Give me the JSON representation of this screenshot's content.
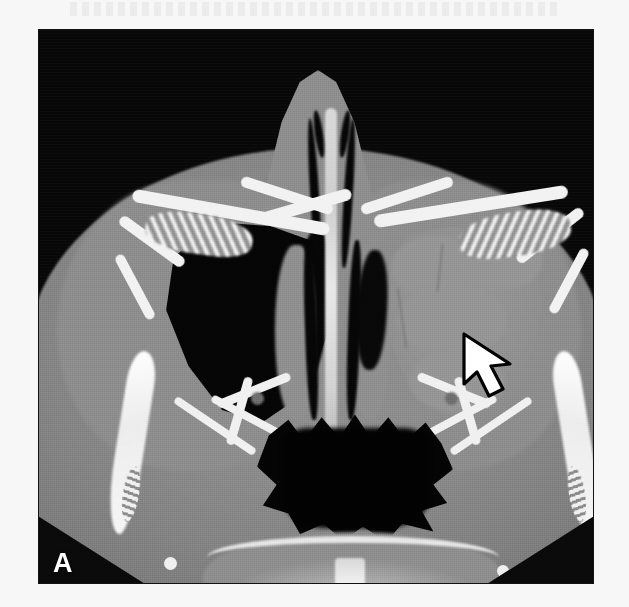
{
  "figure": {
    "panel_label": "A",
    "modality": "CT",
    "plane": "axial",
    "region": "paranasal sinuses",
    "window": "bone",
    "background_color": "#f7f7f7",
    "frame_color": "#0a0a0a"
  },
  "annotations": [
    {
      "name": "arrow-marker",
      "shape": "arrow",
      "direction": "up-left",
      "fill_color": "#ffffff",
      "outline_color": "#000000",
      "x": 419,
      "y": 300,
      "width": 64,
      "height": 70,
      "points_at": "opacified left maxillary sinus"
    }
  ],
  "anatomy": {
    "midline": [
      {
        "name": "nasal-septum",
        "density": "bone",
        "color": "#dcdcdc"
      },
      {
        "name": "nasal-airway-left",
        "density": "air",
        "color": "#060606"
      },
      {
        "name": "nasal-airway-right",
        "density": "air",
        "color": "#060606"
      },
      {
        "name": "nasopharyngeal-airspace",
        "density": "air",
        "color": "#040404"
      }
    ],
    "sinuses": [
      {
        "name": "maxillary-sinus-image-left",
        "status": "aerated",
        "density": "air",
        "color": "#050505"
      },
      {
        "name": "maxillary-sinus-image-right",
        "status": "opacified",
        "density": "soft-tissue",
        "color": "#909090"
      },
      {
        "name": "ethmoid-air-cells-left",
        "status": "aerated",
        "density": "mixed"
      },
      {
        "name": "ethmoid-air-cells-right",
        "status": "aerated",
        "density": "mixed"
      }
    ],
    "bone": [
      {
        "name": "zygomatic-arch-left",
        "color": "#f4f4f4"
      },
      {
        "name": "zygomatic-arch-right",
        "color": "#f4f4f4"
      },
      {
        "name": "orbital-wall-left",
        "color": "#f2f2f2"
      },
      {
        "name": "orbital-wall-right",
        "color": "#f2f2f2"
      },
      {
        "name": "pterygopalatine-strut-left",
        "color": "#f0f0f0"
      },
      {
        "name": "pterygopalatine-strut-right",
        "color": "#f0f0f0"
      },
      {
        "name": "skull-base-arch",
        "color": "#cdcdcd"
      },
      {
        "name": "vertebral-body",
        "color": "#eeeeee"
      }
    ],
    "soft_tissue": [
      {
        "name": "facial-soft-tissue",
        "color": "#8b8b8b"
      },
      {
        "name": "nasal-pyramid",
        "color": "#8e8e8e"
      },
      {
        "name": "cheek-left",
        "color": "#8d8d8d"
      },
      {
        "name": "cheek-right",
        "color": "#8d8d8d"
      }
    ]
  }
}
